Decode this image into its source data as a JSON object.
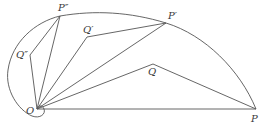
{
  "diagram": {
    "type": "geometric construction",
    "colors": {
      "stroke": "#555555",
      "label": "#3a3a3a",
      "background": "#ffffff"
    },
    "points": {
      "O": {
        "label": "O",
        "x": 37,
        "y": 109
      },
      "P": {
        "label": "P",
        "x": 256,
        "y": 109
      },
      "P1": {
        "label": "P′",
        "x": 166,
        "y": 23
      },
      "P2": {
        "label": "P″",
        "x": 60,
        "y": 16
      },
      "Q": {
        "label": "Q",
        "x": 153,
        "y": 64
      },
      "Q1": {
        "label": "Q′",
        "x": 87,
        "y": 37
      },
      "Q2": {
        "label": "Q″",
        "x": 30,
        "y": 55
      }
    },
    "segments": [
      [
        "O",
        "P"
      ],
      [
        "O",
        "Q"
      ],
      [
        "Q",
        "P"
      ],
      [
        "O",
        "P1"
      ],
      [
        "O",
        "Q1"
      ],
      [
        "Q1",
        "P1"
      ],
      [
        "O",
        "P2"
      ],
      [
        "O",
        "Q2"
      ],
      [
        "Q2",
        "P2"
      ]
    ],
    "curve": "closed loop from P through P′ and P″, around the left side, looping under O"
  }
}
